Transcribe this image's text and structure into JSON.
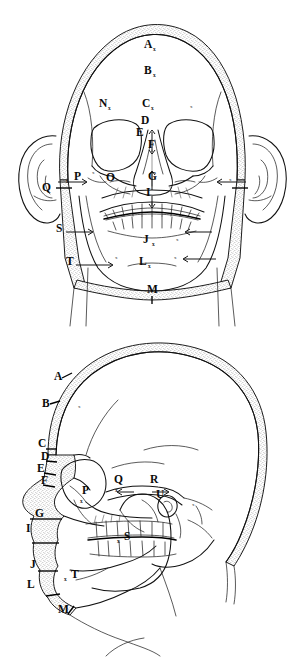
{
  "document": {
    "title": "Facial soft-tissue thickness landmarks",
    "background_color": "#ffffff",
    "ink_color": "#111111",
    "figure_count": 2
  },
  "figures": [
    {
      "id": "frontal",
      "view_name": "norma frontalis",
      "caption": "",
      "landmark_labels": [
        {
          "letter": "A",
          "x": 144,
          "y": 48,
          "marker": "x",
          "marker_dx": 9,
          "marker_dy": 3
        },
        {
          "letter": "B",
          "x": 144,
          "y": 74,
          "marker": "x",
          "marker_dx": 9,
          "marker_dy": 3
        },
        {
          "letter": "C",
          "x": 142,
          "y": 107,
          "marker": "x",
          "marker_dx": 9,
          "marker_dy": 3
        },
        {
          "letter": "D",
          "x": 141,
          "y": 124,
          "marker": "",
          "marker_dx": 0,
          "marker_dy": 0
        },
        {
          "letter": "E",
          "x": 136,
          "y": 136,
          "marker": "",
          "marker_dx": 0,
          "marker_dy": 0
        },
        {
          "letter": "F",
          "x": 148,
          "y": 148,
          "marker": "",
          "marker_dx": 0,
          "marker_dy": 0
        },
        {
          "letter": "G",
          "x": 148,
          "y": 180,
          "marker": "",
          "marker_dx": 0,
          "marker_dy": 0
        },
        {
          "letter": "I",
          "x": 146,
          "y": 196,
          "marker": "",
          "marker_dx": 0,
          "marker_dy": 0
        },
        {
          "letter": "J",
          "x": 143,
          "y": 243,
          "marker": "x",
          "marker_dx": 9,
          "marker_dy": 3
        },
        {
          "letter": "L",
          "x": 139,
          "y": 265,
          "marker": "x",
          "marker_dx": 9,
          "marker_dy": 3
        },
        {
          "letter": "M",
          "x": 147,
          "y": 293,
          "marker": "",
          "marker_dx": 0,
          "marker_dy": 0
        },
        {
          "letter": "N",
          "x": 99,
          "y": 107,
          "marker": "x",
          "marker_dx": 9,
          "marker_dy": 3
        },
        {
          "letter": "O",
          "x": 106,
          "y": 181,
          "marker": "",
          "marker_dx": 0,
          "marker_dy": 0
        },
        {
          "letter": "P",
          "x": 74,
          "y": 180,
          "marker": "x",
          "marker_dx": -8,
          "marker_dy": 3
        },
        {
          "letter": "Q",
          "x": 42,
          "y": 191,
          "marker": "",
          "marker_dx": 0,
          "marker_dy": 0
        },
        {
          "letter": "S",
          "x": 56,
          "y": 232,
          "marker": "",
          "marker_dx": 0,
          "marker_dy": 0
        },
        {
          "letter": "T",
          "x": 66,
          "y": 265,
          "marker": "",
          "marker_dx": 0,
          "marker_dy": 0
        }
      ],
      "unlabeled_markers": [
        {
          "x": 190,
          "y": 108
        },
        {
          "x": 229,
          "y": 181
        },
        {
          "x": 92,
          "y": 174
        },
        {
          "x": 176,
          "y": 241
        },
        {
          "x": 115,
          "y": 259
        },
        {
          "x": 174,
          "y": 259
        }
      ]
    },
    {
      "id": "lateral",
      "view_name": "norma lateralis",
      "caption": "",
      "landmark_labels": [
        {
          "letter": "A",
          "x": 54,
          "y": 380,
          "marker": "",
          "marker_dx": 0,
          "marker_dy": 0
        },
        {
          "letter": "B",
          "x": 42,
          "y": 407,
          "marker": "",
          "marker_dx": 0,
          "marker_dy": 0
        },
        {
          "letter": "C",
          "x": 38,
          "y": 447,
          "marker": "",
          "marker_dx": 0,
          "marker_dy": 0
        },
        {
          "letter": "D",
          "x": 41,
          "y": 460,
          "marker": "",
          "marker_dx": 0,
          "marker_dy": 0
        },
        {
          "letter": "E",
          "x": 37,
          "y": 472,
          "marker": "",
          "marker_dx": 0,
          "marker_dy": 0
        },
        {
          "letter": "F",
          "x": 41,
          "y": 484,
          "marker": "",
          "marker_dx": 0,
          "marker_dy": 0
        },
        {
          "letter": "G",
          "x": 35,
          "y": 517,
          "marker": "",
          "marker_dx": 0,
          "marker_dy": 0
        },
        {
          "letter": "I",
          "x": 26,
          "y": 532,
          "marker": "",
          "marker_dx": 0,
          "marker_dy": 0
        },
        {
          "letter": "J",
          "x": 30,
          "y": 568,
          "marker": "",
          "marker_dx": 0,
          "marker_dy": 0
        },
        {
          "letter": "L",
          "x": 27,
          "y": 588,
          "marker": "",
          "marker_dx": 0,
          "marker_dy": 0
        },
        {
          "letter": "M",
          "x": 58,
          "y": 613,
          "marker": "",
          "marker_dx": 0,
          "marker_dy": 0
        },
        {
          "letter": "P",
          "x": 82,
          "y": 494,
          "marker": "x",
          "marker_dx": -2,
          "marker_dy": 9
        },
        {
          "letter": "Q",
          "x": 114,
          "y": 483,
          "marker": "x",
          "marker_dx": 1,
          "marker_dy": 9
        },
        {
          "letter": "R",
          "x": 150,
          "y": 483,
          "marker": "",
          "marker_dx": 0,
          "marker_dy": 0
        },
        {
          "letter": "S",
          "x": 124,
          "y": 540,
          "marker": "x",
          "marker_dx": -7,
          "marker_dy": 3
        },
        {
          "letter": "T",
          "x": 71,
          "y": 578,
          "marker": "x",
          "marker_dx": -7,
          "marker_dy": 3
        },
        {
          "letter": "U",
          "x": 156,
          "y": 498,
          "marker": "",
          "marker_dx": 0,
          "marker_dy": 0
        }
      ],
      "unlabeled_markers": [
        {
          "x": 78,
          "y": 408
        },
        {
          "x": 192,
          "y": 506
        }
      ]
    }
  ]
}
